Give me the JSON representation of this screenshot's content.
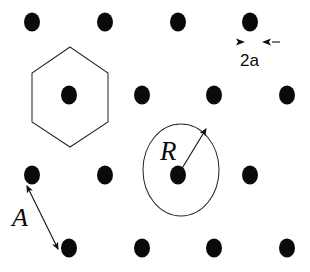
{
  "figure": {
    "background_color": "#ffffff",
    "dot_color": "#0a0a0a",
    "line_color": "#2b2b2b",
    "width": 310,
    "height": 272
  },
  "lattice": {
    "dot_rx": 8,
    "dot_ry": 9.5,
    "rows": [
      {
        "y": 22,
        "xs": [
          32,
          105,
          178,
          250
        ]
      },
      {
        "y": 95,
        "xs": [
          69,
          142,
          214,
          287
        ]
      },
      {
        "y": 175,
        "xs": [
          32,
          105,
          178,
          250
        ]
      },
      {
        "y": 248,
        "xs": [
          69,
          142,
          214,
          287
        ]
      }
    ]
  },
  "hexagon": {
    "name": "unit-cell-hexagon",
    "points": "70,47 108,73 108,122 70,147 32,122 32,73",
    "center": {
      "x": 70,
      "y": 95
    }
  },
  "circle": {
    "name": "radius-circle",
    "cx": 181,
    "cy": 170,
    "rx": 38,
    "ry": 46,
    "arrow_from": {
      "x": 178,
      "y": 175
    },
    "arrow_to": {
      "x": 206,
      "y": 129
    }
  },
  "labels": {
    "radius": {
      "text": "R",
      "x": 160,
      "y": 160,
      "font_size": 27,
      "style": "italic-serif"
    },
    "lattice_vector": {
      "text": "A",
      "x": 12,
      "y": 226,
      "font_size": 26,
      "style": "italic-serif"
    },
    "spacing": {
      "text": "2a",
      "x": 240,
      "y": 66,
      "font_size": 17,
      "style": "sans"
    }
  },
  "spacing_measure": {
    "name": "spacing-measure-2a",
    "left_arrow_tip": {
      "x": 245,
      "y": 42
    },
    "right_arrow_tip": {
      "x": 262,
      "y": 42
    },
    "dash": {
      "x1": 272,
      "y1": 42,
      "x2": 280,
      "y2": 42
    }
  },
  "vector_arrow": {
    "name": "lattice-vector-arrow-A",
    "x1": 27,
    "y1": 186,
    "x2": 58,
    "y2": 249,
    "double_headed": true
  }
}
